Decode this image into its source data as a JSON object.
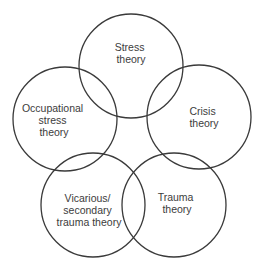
{
  "diagram": {
    "width": 262,
    "height": 269,
    "background": "#ffffff",
    "stroke_color": "#3a3a3a",
    "text_color": "#3c3c3c",
    "line_height": 12,
    "nodes": [
      {
        "id": "stress-theory",
        "label_lines": [
          "Stress",
          "theory"
        ],
        "cx": 131,
        "cy": 66,
        "r": 52,
        "text_x": 131,
        "text_y": 51
      },
      {
        "id": "occupational-stress-theory",
        "label_lines": [
          "Occupational",
          "stress",
          "theory"
        ],
        "cx": 65,
        "cy": 119,
        "r": 52,
        "text_x": 54,
        "text_y": 112
      },
      {
        "id": "crisis-theory",
        "label_lines": [
          "Crisis",
          "theory"
        ],
        "cx": 199,
        "cy": 117,
        "r": 52,
        "text_x": 204,
        "text_y": 115
      },
      {
        "id": "vicarious-secondary-trauma-theory",
        "label_lines": [
          "Vicarious/",
          "secondary",
          "trauma theory"
        ],
        "cx": 93,
        "cy": 205,
        "r": 52,
        "text_x": 89,
        "text_y": 202
      },
      {
        "id": "trauma-theory",
        "label_lines": [
          "Trauma",
          "theory"
        ],
        "cx": 174,
        "cy": 205,
        "r": 52,
        "text_x": 177,
        "text_y": 201
      }
    ]
  }
}
